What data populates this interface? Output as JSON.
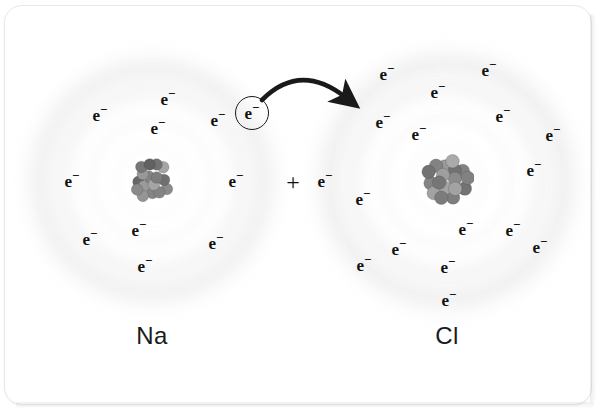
{
  "figure": {
    "caption_left": "Na",
    "caption_right": "Cl",
    "plus": "+",
    "electron_symbol": "e",
    "electron_charge": "−",
    "arrow_name": "electron-transfer-arrow",
    "colors": {
      "background": "#ffffff",
      "text": "#111111",
      "shell_cloud": "#cfcfcf",
      "nucleus_dark": "#5a5a5a",
      "nucleus_light": "#a8a8a8",
      "arrow": "#1a1a1a",
      "frame_border": "#e8e8e8"
    }
  },
  "atoms": [
    {
      "id": "sodium",
      "symbol": "Na",
      "name_label": "Na",
      "center": {
        "x": 152,
        "y": 181
      },
      "label_pos": {
        "x": 152,
        "y": 336
      },
      "shells": [
        {
          "radius": 36,
          "opacity": 0.3
        },
        {
          "radius": 62,
          "opacity": 0.26
        },
        {
          "radius": 92,
          "opacity": 0.22
        },
        {
          "radius": 116,
          "opacity": 0.16
        }
      ],
      "nucleus_radius": 23,
      "electron_count": 11,
      "electrons": [
        {
          "x": 100,
          "y": 115,
          "circled": false
        },
        {
          "x": 168,
          "y": 99,
          "circled": false
        },
        {
          "x": 158,
          "y": 128,
          "circled": false
        },
        {
          "x": 218,
          "y": 120,
          "circled": false
        },
        {
          "x": 252,
          "y": 113,
          "circled": true
        },
        {
          "x": 72,
          "y": 181,
          "circled": false
        },
        {
          "x": 236,
          "y": 181,
          "circled": false
        },
        {
          "x": 90,
          "y": 239,
          "circled": false
        },
        {
          "x": 139,
          "y": 230,
          "circled": false
        },
        {
          "x": 216,
          "y": 243,
          "circled": false
        },
        {
          "x": 145,
          "y": 266,
          "circled": false
        }
      ]
    },
    {
      "id": "chlorine",
      "symbol": "Cl",
      "name_label": "Cl",
      "center": {
        "x": 447,
        "y": 181
      },
      "label_pos": {
        "x": 447,
        "y": 336
      },
      "shells": [
        {
          "radius": 38,
          "opacity": 0.3
        },
        {
          "radius": 66,
          "opacity": 0.26
        },
        {
          "radius": 96,
          "opacity": 0.22
        },
        {
          "radius": 122,
          "opacity": 0.16
        }
      ],
      "nucleus_radius": 27,
      "electron_count": 17,
      "electrons": [
        {
          "x": 325,
          "y": 181,
          "circled": false,
          "outside": true
        },
        {
          "x": 387,
          "y": 74,
          "circled": false
        },
        {
          "x": 489,
          "y": 70,
          "circled": false
        },
        {
          "x": 438,
          "y": 92,
          "circled": false
        },
        {
          "x": 383,
          "y": 122,
          "circled": false
        },
        {
          "x": 419,
          "y": 134,
          "circled": false
        },
        {
          "x": 503,
          "y": 116,
          "circled": false
        },
        {
          "x": 553,
          "y": 135,
          "circled": false
        },
        {
          "x": 534,
          "y": 170,
          "circled": false
        },
        {
          "x": 363,
          "y": 199,
          "circled": false
        },
        {
          "x": 466,
          "y": 229,
          "circled": false
        },
        {
          "x": 513,
          "y": 230,
          "circled": false
        },
        {
          "x": 540,
          "y": 247,
          "circled": false
        },
        {
          "x": 399,
          "y": 249,
          "circled": false
        },
        {
          "x": 364,
          "y": 265,
          "circled": false
        },
        {
          "x": 448,
          "y": 267,
          "circled": false
        },
        {
          "x": 449,
          "y": 300,
          "circled": false
        }
      ]
    }
  ],
  "plus_sign": {
    "x": 293,
    "y": 182,
    "text": "+"
  },
  "arrow": {
    "start": {
      "x": 262,
      "y": 100
    },
    "end": {
      "x": 345,
      "y": 97
    },
    "control": {
      "x": 300,
      "y": 62
    }
  },
  "chart_data": {
    "type": "diagram",
    "elements": [
      {
        "label": "Na",
        "electrons": 11,
        "role": "electron donor"
      },
      {
        "label": "Cl",
        "electrons": 17,
        "role": "electron acceptor"
      }
    ],
    "annotations": [
      "One valence electron of Na is circled",
      "Curved arrow indicates transfer of that electron from Na to Cl",
      "Plus sign joins the two reactants"
    ]
  }
}
